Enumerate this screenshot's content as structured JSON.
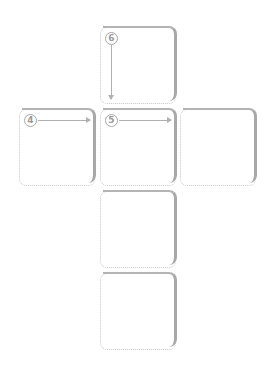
{
  "diagram": {
    "type": "cube-net",
    "faces": [
      {
        "id": "top",
        "label": "6",
        "arrow": "down"
      },
      {
        "id": "left",
        "label": "4",
        "arrow": "right"
      },
      {
        "id": "center",
        "label": "5",
        "arrow": "right"
      },
      {
        "id": "right",
        "label": "",
        "arrow": ""
      },
      {
        "id": "below-1",
        "label": "",
        "arrow": ""
      },
      {
        "id": "below-2",
        "label": "",
        "arrow": ""
      }
    ]
  }
}
